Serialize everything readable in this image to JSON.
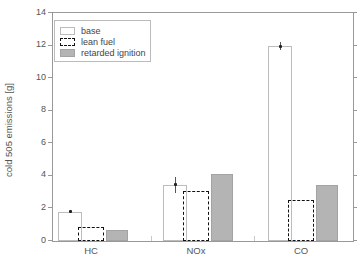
{
  "chart_data": {
    "type": "bar",
    "title": "",
    "xlabel": "",
    "ylabel": "cold 505 emissions [g]",
    "ylim": [
      0,
      14
    ],
    "yticks": [
      0,
      2,
      4,
      6,
      8,
      10,
      12,
      14
    ],
    "categories": [
      "HC",
      "NOx",
      "CO"
    ],
    "series": [
      {
        "name": "base",
        "values": [
          1.8,
          3.45,
          11.95
        ],
        "errors": [
          0.08,
          0.5,
          0.25
        ],
        "fill": "#ffffff",
        "border": "#bcbcbc",
        "border_style": "solid"
      },
      {
        "name": "lean fuel",
        "values": [
          0.85,
          3.1,
          2.5
        ],
        "fill": "transparent",
        "border": "#111111",
        "border_style": "dashed"
      },
      {
        "name": "retarded ignition",
        "values": [
          0.7,
          4.1,
          3.45
        ],
        "fill": "#b4b4b4",
        "border": "#a3a3a3",
        "border_style": "solid"
      }
    ],
    "legend_position": "top-left-inside",
    "grid": false,
    "axis_color": "#999999",
    "text_color": "#555555",
    "error_marker_color": "#222222"
  }
}
